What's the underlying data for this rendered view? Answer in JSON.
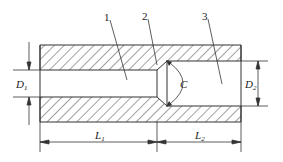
{
  "diagram": {
    "type": "technical-cross-section",
    "part_labels": [
      {
        "id": "1",
        "text": "1"
      },
      {
        "id": "2",
        "text": "2"
      },
      {
        "id": "3",
        "text": "3"
      }
    ],
    "dimensions": {
      "D1": {
        "main": "D",
        "sub": "1"
      },
      "D2": {
        "main": "D",
        "sub": "2"
      },
      "C": {
        "main": "C"
      },
      "L1": {
        "main": "L",
        "sub": "1"
      },
      "L2": {
        "main": "L",
        "sub": "2"
      }
    },
    "colors": {
      "line": "#333333",
      "hatch": "#444444",
      "background": "#ffffff"
    }
  }
}
